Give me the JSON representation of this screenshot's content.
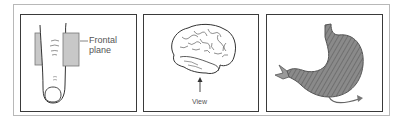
{
  "figure": {
    "panels": [
      {
        "id": "finger",
        "subject": "finger-icon",
        "labels": {
          "line1": "Frontal",
          "line2": "plane"
        }
      },
      {
        "id": "brain",
        "subject": "brain-icon",
        "labels": {
          "view": "View"
        }
      },
      {
        "id": "stomach",
        "subject": "stomach-icon",
        "labels": {}
      }
    ],
    "colors": {
      "frame": "#3a3a3a",
      "outer_frame": "#b8b8b8",
      "plane_fill": "#c8c8c8",
      "stomach_fill": "#7a7a7a",
      "line": "#333333"
    }
  }
}
